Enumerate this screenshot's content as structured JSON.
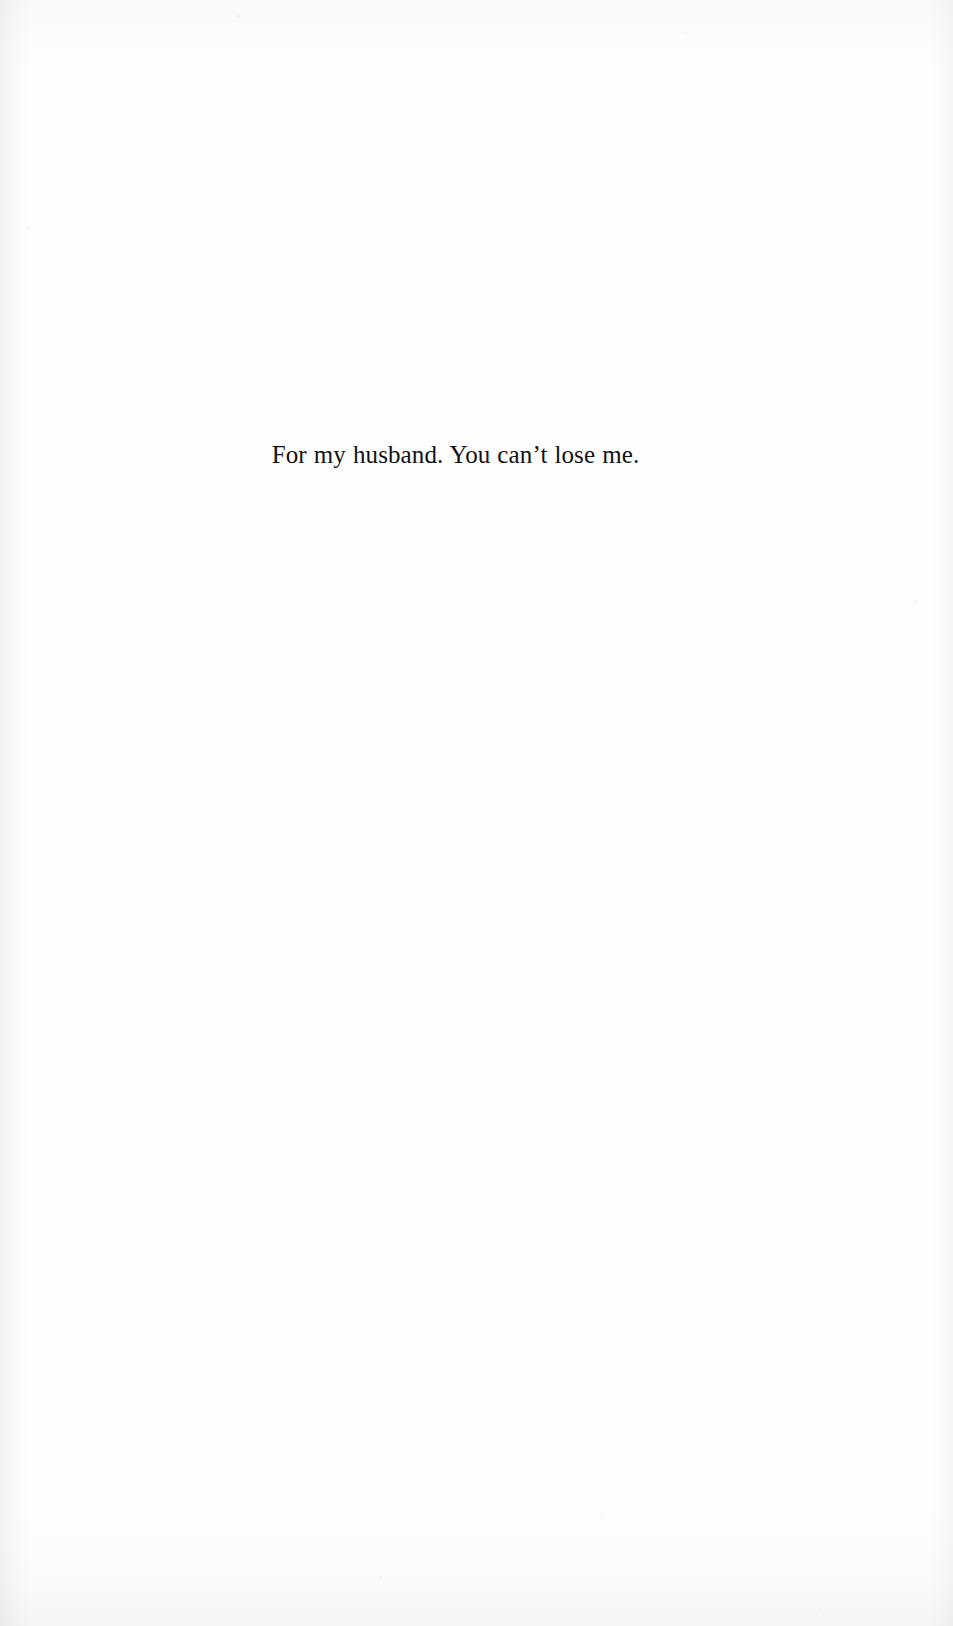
{
  "page": {
    "kind": "book-dedication-page",
    "background_color": "#fefefe",
    "width": 953,
    "height": 1626
  },
  "dedication": {
    "text": "For my husband. You can’t lose me.",
    "text_color": "#111113",
    "alignment": "center",
    "font_style": "serif"
  },
  "artifacts": {
    "vignette_color": "#8e9196"
  }
}
